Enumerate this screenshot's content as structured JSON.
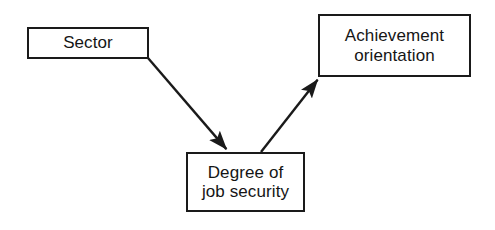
{
  "diagram": {
    "background_color": "#ffffff",
    "line_color": "#1a1a1a",
    "text_color": "#151515",
    "nodes": [
      {
        "id": "sector",
        "label": "Sector",
        "x": 27,
        "y": 27,
        "width": 122,
        "height": 32
      },
      {
        "id": "security",
        "label": "Degree of\njob security",
        "x": 186,
        "y": 152,
        "width": 119,
        "height": 60
      },
      {
        "id": "achievement",
        "label": "Achievement\norientation",
        "x": 318,
        "y": 14,
        "width": 153,
        "height": 63
      }
    ],
    "edges": [
      {
        "id": "sector-to-security",
        "from": "sector",
        "to": "security",
        "arrowhead": "filled-triangle",
        "x1": 148,
        "y1": 58,
        "x2": 228,
        "y2": 151
      },
      {
        "id": "security-to-achievement",
        "from": "security",
        "to": "achievement",
        "arrowhead": "filled-triangle",
        "x1": 261,
        "y1": 152,
        "x2": 319,
        "y2": 78
      }
    ]
  }
}
